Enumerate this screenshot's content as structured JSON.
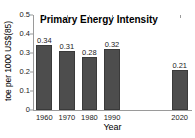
{
  "chart_data": {
    "type": "bar",
    "title": "Primary Energy Intensity",
    "xlabel": "Year",
    "ylabel": "toe per 1000 US$(85)",
    "categories": [
      "1960",
      "1970",
      "1980",
      "1990",
      "2020"
    ],
    "values": [
      0.34,
      0.31,
      0.28,
      0.32,
      0.21
    ],
    "value_labels": [
      "0.34",
      "0.31",
      "0.28",
      "0.32",
      "0.21"
    ],
    "ylim": [
      0,
      0.5
    ],
    "yticks": [
      0,
      0.1,
      0.2,
      0.3,
      0.4,
      0.5
    ],
    "ytick_labels": [
      "0",
      "0.1",
      "0.2",
      "0.3",
      "0.4",
      "0.5"
    ],
    "xlim": [
      1955,
      2025
    ],
    "grid": false,
    "legend": null,
    "bar_color": "#4d4d4d",
    "bar_edge_color": "#3a3a3a",
    "axis_color": "#9a9a9a",
    "text_color": "#1a1a1a",
    "background": "#ffffff",
    "bar_width_years": 7
  }
}
